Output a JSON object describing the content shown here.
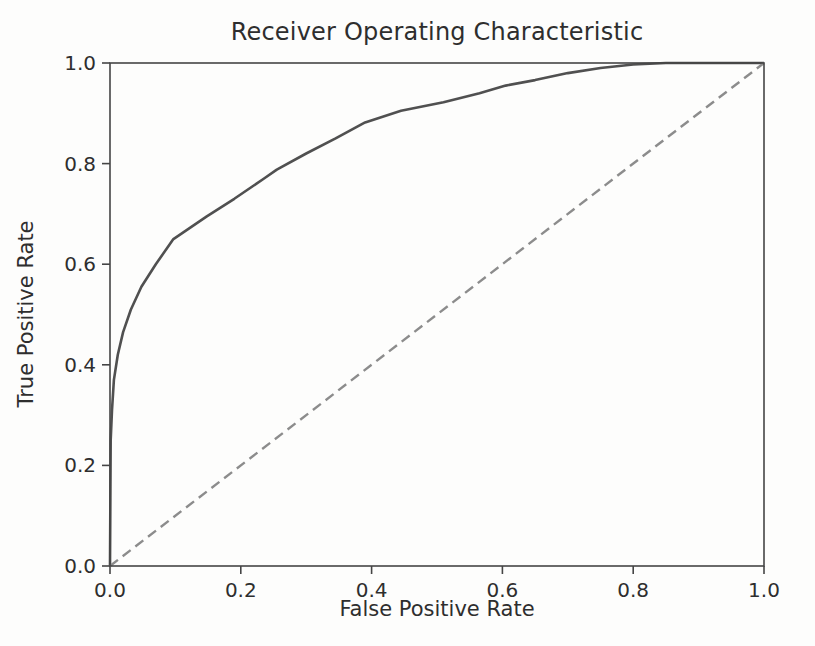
{
  "figure": {
    "background_color": "#fdfdfc",
    "text_color": "#2e2e2e",
    "spine_color": "#454545"
  },
  "chart_data": {
    "type": "line",
    "title": "Receiver Operating Characteristic",
    "xlabel": "False Positive Rate",
    "ylabel": "True Positive Rate",
    "xlim": [
      0.0,
      1.0
    ],
    "ylim": [
      0.0,
      1.0
    ],
    "xticks": [
      0.0,
      0.2,
      0.4,
      0.6,
      0.8,
      1.0
    ],
    "yticks": [
      0.0,
      0.2,
      0.4,
      0.6,
      0.8,
      1.0
    ],
    "xtick_labels": [
      "0.0",
      "0.2",
      "0.4",
      "0.6",
      "0.8",
      "1.0"
    ],
    "ytick_labels": [
      "0.0",
      "0.2",
      "0.4",
      "0.6",
      "0.8",
      "1.0"
    ],
    "grid": false,
    "legend": null,
    "series": [
      {
        "name": "roc-curve",
        "style": "solid",
        "color": "#505050",
        "line_width": 2.6,
        "x": [
          0.0,
          0.001,
          0.003,
          0.006,
          0.012,
          0.02,
          0.032,
          0.048,
          0.07,
          0.097,
          0.148,
          0.19,
          0.235,
          0.255,
          0.3,
          0.345,
          0.39,
          0.445,
          0.51,
          0.565,
          0.605,
          0.65,
          0.7,
          0.75,
          0.8,
          0.85,
          1.0
        ],
        "y": [
          0.0,
          0.25,
          0.31,
          0.37,
          0.42,
          0.465,
          0.51,
          0.555,
          0.6,
          0.65,
          0.695,
          0.73,
          0.77,
          0.788,
          0.82,
          0.85,
          0.882,
          0.905,
          0.922,
          0.94,
          0.955,
          0.966,
          0.98,
          0.99,
          0.997,
          1.0,
          1.0
        ]
      },
      {
        "name": "chance-diagonal",
        "style": "dashed",
        "color": "#8c8c8c",
        "line_width": 2.4,
        "dash": [
          10,
          6
        ],
        "x": [
          0.0,
          1.0
        ],
        "y": [
          0.0,
          1.0
        ]
      }
    ]
  }
}
